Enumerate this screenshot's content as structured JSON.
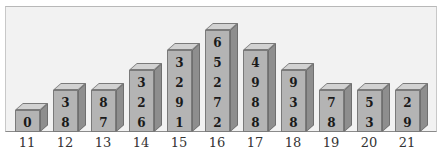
{
  "chart_data": {
    "type": "bar",
    "title": "",
    "xlabel": "",
    "ylabel": "",
    "style": "3d-column",
    "grid": false,
    "legend": null,
    "categories": [
      "11",
      "12",
      "13",
      "14",
      "15",
      "16",
      "17",
      "18",
      "19",
      "20",
      "21"
    ],
    "values": [
      1,
      2,
      2,
      3,
      4,
      5,
      4,
      3,
      2,
      2,
      2
    ],
    "bar_digits": [
      [
        "0"
      ],
      [
        "3",
        "8"
      ],
      [
        "8",
        "7"
      ],
      [
        "3",
        "2",
        "6"
      ],
      [
        "3",
        "2",
        "9",
        "1"
      ],
      [
        "6",
        "5",
        "2",
        "7",
        "2"
      ],
      [
        "4",
        "9",
        "8",
        "8"
      ],
      [
        "9",
        "3",
        "8"
      ],
      [
        "7",
        "8"
      ],
      [
        "5",
        "3"
      ],
      [
        "2",
        "9"
      ]
    ],
    "colors": {
      "bar_front": "#b4b4b4",
      "bar_side": "#8e8e8e",
      "bar_top": "#d2d2d2",
      "background": "#f2f2f2"
    }
  },
  "bars": [
    {
      "label": "11",
      "d": [
        "0"
      ]
    },
    {
      "label": "12",
      "d": [
        "3",
        "8"
      ]
    },
    {
      "label": "13",
      "d": [
        "8",
        "7"
      ]
    },
    {
      "label": "14",
      "d": [
        "3",
        "2",
        "6"
      ]
    },
    {
      "label": "15",
      "d": [
        "3",
        "2",
        "9",
        "1"
      ]
    },
    {
      "label": "16",
      "d": [
        "6",
        "5",
        "2",
        "7",
        "2"
      ]
    },
    {
      "label": "17",
      "d": [
        "4",
        "9",
        "8",
        "8"
      ]
    },
    {
      "label": "18",
      "d": [
        "9",
        "3",
        "8"
      ]
    },
    {
      "label": "19",
      "d": [
        "7",
        "8"
      ]
    },
    {
      "label": "20",
      "d": [
        "5",
        "3"
      ]
    },
    {
      "label": "21",
      "d": [
        "2",
        "9"
      ]
    }
  ]
}
